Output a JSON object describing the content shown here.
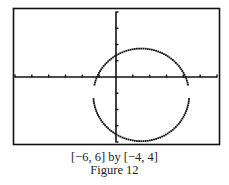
{
  "chart_data": {
    "type": "scatter",
    "title": "",
    "xlabel": "",
    "ylabel": "",
    "xlim": [
      -6,
      6
    ],
    "ylim": [
      -4,
      4
    ],
    "xtick_step": 1,
    "ytick_step": 1,
    "grid": false,
    "legend": null,
    "series": [
      {
        "name": "circle",
        "shape": "circle",
        "center": [
          1.5,
          -1.1
        ],
        "radius": 2.85,
        "style": "dotted calculator pixels",
        "gaps_near_x_axis_left_right": true
      }
    ],
    "window_label": "[−6, 6] by [−4, 4]",
    "caption": "Figure 12"
  },
  "caption": {
    "window": "[−6, 6] by [−4, 4]",
    "figure": "Figure 12"
  },
  "colors": {
    "ink": "#111111",
    "background": "#ffffff"
  }
}
